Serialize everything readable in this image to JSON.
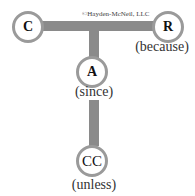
{
  "diagram": {
    "type": "argument-structure",
    "copyright": "©Hayden-McNeil, LLC",
    "nodes": {
      "claim": {
        "letter": "C"
      },
      "reason": {
        "letter": "R",
        "caption": "(because)"
      },
      "assumption": {
        "letter": "A",
        "caption": "(since)"
      },
      "counterclaim": {
        "letter": "CC",
        "caption": "(unless)"
      }
    },
    "colors": {
      "connector": "#8a8a8a",
      "circle_border": "#9a9a9a",
      "text": "#111111",
      "caption": "#333333",
      "background": "#ffffff"
    }
  }
}
